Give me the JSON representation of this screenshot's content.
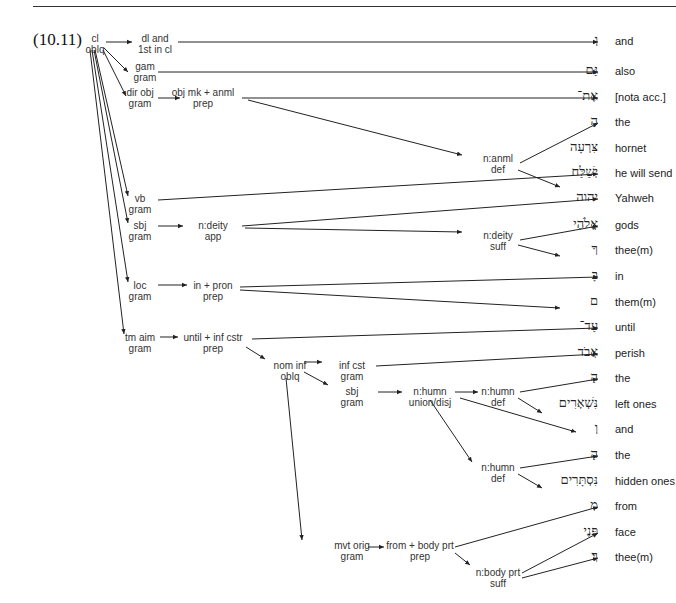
{
  "example_number": "(10.11)",
  "nodes": {
    "cl": [
      "cl",
      "oblq"
    ],
    "dl": [
      "dl and",
      "1st in cl"
    ],
    "gam": [
      "gam",
      "gram"
    ],
    "dirobj": [
      "dir obj",
      "gram"
    ],
    "objmk": [
      "obj mk + anml",
      "prep"
    ],
    "nanml": [
      "n:anml",
      "def"
    ],
    "vb": [
      "vb",
      "gram"
    ],
    "sbj": [
      "sbj",
      "gram"
    ],
    "ndeity": [
      "n:deity",
      "app"
    ],
    "ndeitysuff": [
      "n:deity",
      "suff"
    ],
    "loc": [
      "loc",
      "gram"
    ],
    "inpron": [
      "in + pron",
      "prep"
    ],
    "tmaim": [
      "tm aim",
      "gram"
    ],
    "until": [
      "until + inf cstr",
      "prep"
    ],
    "nominf": [
      "nom inf",
      "oblq"
    ],
    "infcst": [
      "inf cst",
      "gram"
    ],
    "sbj2": [
      "sbj",
      "gram"
    ],
    "nhumnunion": [
      "n:humn",
      "union/disj"
    ],
    "nhumndef1": [
      "n:humn",
      "def"
    ],
    "nhumndef2": [
      "n:humn",
      "def"
    ],
    "mvtorig": [
      "mvt orig",
      "gram"
    ],
    "frombody": [
      "from + body prt",
      "prep"
    ],
    "nbody": [
      "n:body prt",
      "suff"
    ]
  },
  "words": [
    {
      "hebrew": "וְ",
      "gloss": "and"
    },
    {
      "hebrew": "גַּם",
      "gloss": "also"
    },
    {
      "hebrew": "אֶת־",
      "gloss": "[nota acc.]"
    },
    {
      "hebrew": "הַ",
      "gloss": "the"
    },
    {
      "hebrew": "צִּרְעָה",
      "gloss": "hornet"
    },
    {
      "hebrew": "יְשַׁלַּח",
      "gloss": "he will send"
    },
    {
      "hebrew": "יהוה",
      "gloss": "Yahweh"
    },
    {
      "hebrew": "אֱלֹהֶי",
      "gloss": "gods"
    },
    {
      "hebrew": "ךָ",
      "gloss": "thee(m)"
    },
    {
      "hebrew": "בָּ",
      "gloss": "in"
    },
    {
      "hebrew": "ם",
      "gloss": "them(m)"
    },
    {
      "hebrew": "עַד־",
      "gloss": "until"
    },
    {
      "hebrew": "אֲבֹד",
      "gloss": "perish"
    },
    {
      "hebrew": "הַ",
      "gloss": "the"
    },
    {
      "hebrew": "נִּשְׁאָרִים",
      "gloss": "left ones"
    },
    {
      "hebrew": "וְ",
      "gloss": "and"
    },
    {
      "hebrew": "הַ",
      "gloss": "the"
    },
    {
      "hebrew": "נִּסְתָּרִים",
      "gloss": "hidden ones"
    },
    {
      "hebrew": "מִ",
      "gloss": "from"
    },
    {
      "hebrew": "פָּנֶי",
      "gloss": "face"
    },
    {
      "hebrew": "ךָ׃",
      "gloss": "thee(m)"
    }
  ]
}
